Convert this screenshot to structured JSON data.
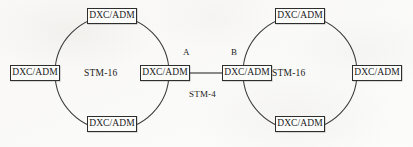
{
  "diagram": {
    "node_label": "DXC/ADM",
    "rings": [
      {
        "id": "left-ring",
        "capacity_label": "STM-16",
        "center": {
          "x": 112,
          "y": 73
        },
        "radius": 57,
        "nodes": [
          {
            "id": "left-ring-node-top",
            "label": "DXC/ADM",
            "position": "top",
            "cx": 112,
            "cy": 16
          },
          {
            "id": "left-ring-node-left",
            "label": "DXC/ADM",
            "position": "left",
            "cx": 35,
            "cy": 73
          },
          {
            "id": "left-ring-node-right",
            "label": "DXC/ADM",
            "position": "right",
            "cx": 165,
            "cy": 73
          },
          {
            "id": "left-ring-node-bottom",
            "label": "DXC/ADM",
            "position": "bottom",
            "cx": 112,
            "cy": 124
          }
        ]
      },
      {
        "id": "right-ring",
        "capacity_label": "STM-16",
        "center": {
          "x": 300,
          "y": 73
        },
        "radius": 57,
        "nodes": [
          {
            "id": "right-ring-node-top",
            "label": "DXC/ADM",
            "position": "top",
            "cx": 300,
            "cy": 16
          },
          {
            "id": "right-ring-node-left",
            "label": "DXC/ADM",
            "position": "left",
            "cx": 247,
            "cy": 73
          },
          {
            "id": "right-ring-node-right",
            "label": "DXC/ADM",
            "position": "right",
            "cx": 377,
            "cy": 73
          },
          {
            "id": "right-ring-node-bottom",
            "label": "DXC/ADM",
            "position": "bottom",
            "cx": 300,
            "cy": 124
          }
        ]
      }
    ],
    "gateway_points": [
      {
        "id": "point-a",
        "label": "A",
        "x": 185,
        "y": 52
      },
      {
        "id": "point-b",
        "label": "B",
        "x": 233,
        "y": 52
      }
    ],
    "interconnect": {
      "id": "stm4-link",
      "label": "STM-4",
      "label_x": 196,
      "label_y": 92,
      "from_x": 190,
      "to_x": 222,
      "y": 73
    },
    "box": {
      "width": 50,
      "height": 16
    },
    "colors": {
      "stroke": "#2e2e2e",
      "text": "#1b1b1b",
      "paper": "#fbfbfa",
      "box_fill": "#fcfcfb"
    }
  }
}
